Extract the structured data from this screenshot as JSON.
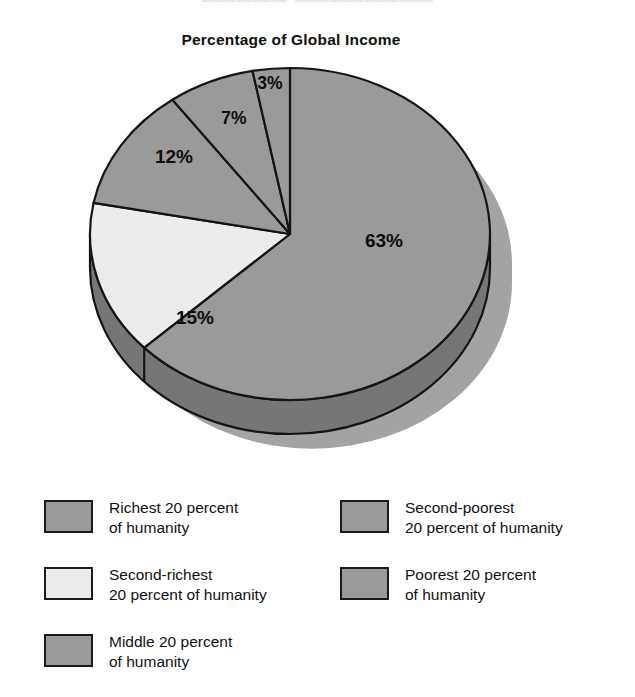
{
  "page": {
    "top_bleed_text": "█████ ████████",
    "background": "#ffffff"
  },
  "chart_data": {
    "type": "pie",
    "title": "Percentage of Global Income",
    "xlabel": "",
    "ylabel": "",
    "legend_position": "bottom",
    "grid": false,
    "units": "percent",
    "start_angle_deg": 0,
    "direction": "clockwise",
    "categories": [
      "Richest 20 percent of humanity",
      "Second-richest 20 percent of humanity",
      "Middle 20 percent of humanity",
      "Second-poorest 20 percent of humanity",
      "Poorest 20 percent of humanity"
    ],
    "values": [
      63,
      15,
      12,
      7,
      3
    ],
    "labels": [
      "63%",
      "15%",
      "12%",
      "7%",
      "3%"
    ],
    "colors": [
      "#9a9a9a",
      "#e9e9e9",
      "#9a9a9a",
      "#9a9a9a",
      "#9a9a9a"
    ],
    "slices": [
      {
        "label": "63%",
        "value": 63,
        "category": "Richest 20 percent of humanity",
        "color": "#9a9a9a",
        "label_x": 384,
        "label_y": 187
      },
      {
        "label": "15%",
        "value": 15,
        "category": "Second-richest 20 percent of humanity",
        "color": "#ececec",
        "label_x": 195,
        "label_y": 264
      },
      {
        "label": "12%",
        "value": 12,
        "category": "Middle 20 percent of humanity",
        "color": "#9a9a9a",
        "label_x": 174,
        "label_y": 103
      },
      {
        "label": "7%",
        "value": 7,
        "category": "Second-poorest 20 percent of humanity",
        "color": "#9a9a9a",
        "label_x": 234,
        "label_y": 64
      },
      {
        "label": "3%",
        "value": 3,
        "category": "Poorest 20 percent of humanity",
        "color": "#9a9a9a",
        "label_x": 270,
        "label_y": 29
      }
    ],
    "depth_color": "#767676",
    "shadow_color": "#a3a3a3",
    "outline_color": "#141414"
  },
  "legend": {
    "left_column": [
      {
        "swatch_color": "#9a9a9a",
        "line1": "Richest 20 percent",
        "line2": "of humanity",
        "text": "Richest 20 percent\nof humanity"
      },
      {
        "swatch_color": "#ececec",
        "line1": "Second-richest",
        "line2": "20 percent of humanity",
        "text": "Second-richest\n20 percent of humanity"
      },
      {
        "swatch_color": "#9a9a9a",
        "line1": "Middle 20 percent",
        "line2": "of humanity",
        "text": "Middle 20 percent\nof humanity"
      }
    ],
    "right_column": [
      {
        "swatch_color": "#9a9a9a",
        "line1": "Second-poorest",
        "line2": "20 percent of humanity",
        "text": "Second-poorest\n20 percent of humanity"
      },
      {
        "swatch_color": "#9a9a9a",
        "line1": "Poorest 20 percent",
        "line2": "of humanity",
        "text": "Poorest 20 percent\nof humanity"
      }
    ]
  }
}
